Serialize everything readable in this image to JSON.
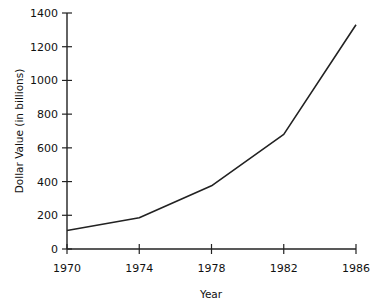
{
  "chart_data": {
    "type": "line",
    "title": "",
    "xlabel": "Year",
    "ylabel": "Dollar Value (in billions)",
    "x": [
      1970,
      1974,
      1978,
      1982,
      1986
    ],
    "series": [
      {
        "name": "Dollar Value",
        "values": [
          110,
          185,
          375,
          680,
          1330
        ]
      }
    ],
    "xticks": [
      "1970",
      "1974",
      "1978",
      "1982",
      "1986"
    ],
    "yticks": [
      "0",
      "200",
      "400",
      "600",
      "800",
      "1000",
      "1200",
      "1400"
    ],
    "ylim": [
      0,
      1400
    ],
    "xlim": [
      1970,
      1986
    ],
    "grid": false,
    "legend": null,
    "line_color": "#222222"
  }
}
